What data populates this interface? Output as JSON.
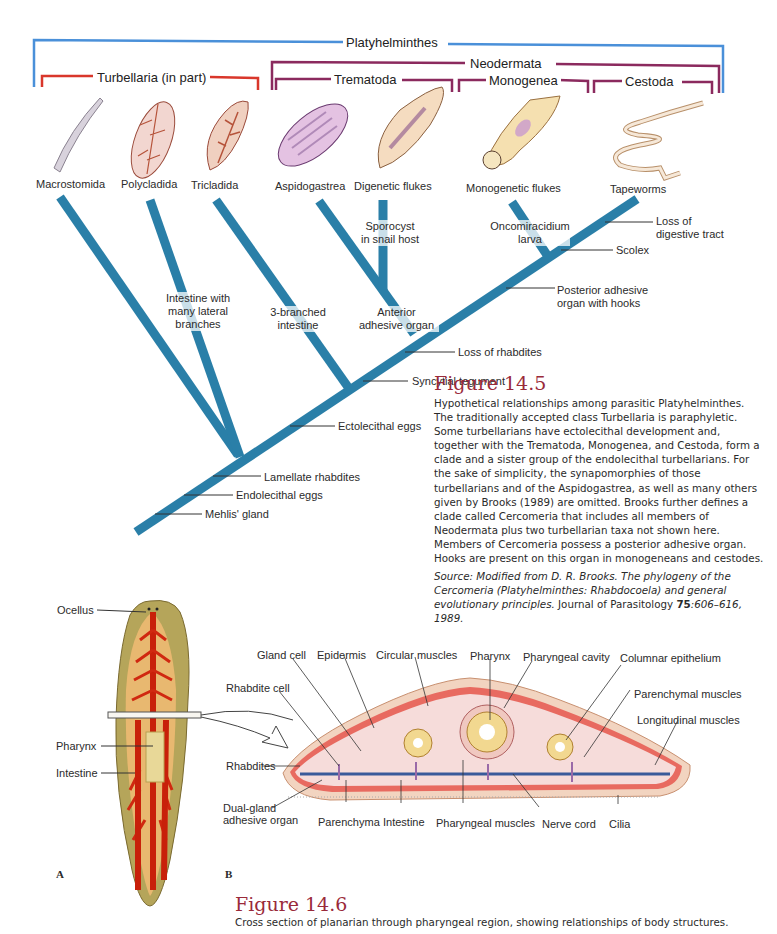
{
  "colors": {
    "platyhelminthes_bracket": "#4a90d9",
    "turbellaria_bracket": "#d9372b",
    "neodermata_bracket": "#8b2a5e",
    "tree_branch": "#2a7fa8",
    "figure_title": "#9a2a3a"
  },
  "cladogram": {
    "groups": {
      "platyhelminthes": "Platyhelminthes",
      "neodermata": "Neodermata",
      "turbellaria": "Turbellaria (in part)",
      "trematoda": "Trematoda",
      "monogenea": "Monogenea",
      "cestoda": "Cestoda"
    },
    "taxa": [
      {
        "name": "Macrostomida"
      },
      {
        "name": "Polycladida"
      },
      {
        "name": "Tricladida"
      },
      {
        "name": "Aspidogastrea"
      },
      {
        "name": "Digenetic flukes"
      },
      {
        "name": "Monogenetic flukes"
      },
      {
        "name": "Tapeworms"
      }
    ],
    "branch_labels": {
      "intestine_lateral": "Intestine with many lateral branches",
      "three_branched": "3-branched intestine",
      "anterior_adhesive": "Anterior adhesive organ",
      "sporocyst": "Sporocyst in snail host",
      "oncomiracidium": "Oncomiracidium larva"
    },
    "trunk_labels": {
      "loss_digestive": "Loss of digestive tract",
      "scolex": "Scolex",
      "posterior_adhesive": "Posterior adhesive organ with hooks",
      "loss_rhabdites": "Loss of rhabdites",
      "syncytial": "Syncytial tegument",
      "ectolecithal": "Ectolecithal eggs",
      "lamellate": "Lamellate rhabdites",
      "endolecithal": "Endolecithal eggs",
      "mehlis": "Mehlis' gland"
    }
  },
  "figure_14_5": {
    "title": "Figure 14.5",
    "caption": "Hypothetical relationships among parasitic Platyhelminthes. The traditionally accepted class Turbellaria is paraphyletic. Some turbellarians have ectolecithal development and, together with the Trematoda, Monogenea, and Cestoda, form a clade and a sister group of the endolecithal turbellarians. For the sake of simplicity, the synapomorphies of those turbellarians and of the Aspidogastrea, as well as many others given by Brooks (1989) are omitted. Brooks further defines a clade called Cercomeria that includes all members of Neodermata plus two turbellarian taxa not shown here. Members of Cercomeria possess a posterior adhesive organ. Hooks are present on this organ in monogeneans and cestodes.",
    "source_prefix": "Source: Modified from D. R. Brooks. The phylogeny of the Cercomeria (Platyhelminthes: Rhabdocoela) and general evolutionary principles. ",
    "source_journal": "Journal of Parasitology ",
    "source_volume": "75",
    "source_pages": ":606–616, 1989."
  },
  "planarian": {
    "panel_a": "A",
    "panel_b": "B",
    "a_labels": {
      "ocellus": "Ocellus",
      "pharynx": "Pharynx",
      "intestine": "Intestine"
    },
    "b_labels": {
      "gland_cell": "Gland cell",
      "epidermis": "Epidermis",
      "circular_muscles": "Circular muscles",
      "pharynx": "Pharynx",
      "pharyngeal_cavity": "Pharyngeal cavity",
      "columnar_epithelium": "Columnar epithelium",
      "rhabdite_cell": "Rhabdite cell",
      "parenchymal_muscles": "Parenchymal muscles",
      "longitudinal_muscles": "Longitudinal muscles",
      "rhabdites": "Rhabdites",
      "dual_gland_1": "Dual-gland",
      "dual_gland_2": "adhesive organ",
      "parenchyma": "Parenchyma",
      "intestine": "Intestine",
      "pharyngeal_muscles": "Pharyngeal muscles",
      "nerve_cord": "Nerve cord",
      "cilia": "Cilia"
    }
  },
  "figure_14_6": {
    "title": "Figure 14.6",
    "caption": "Cross section of planarian through pharyngeal region, showing relationships of body structures."
  }
}
